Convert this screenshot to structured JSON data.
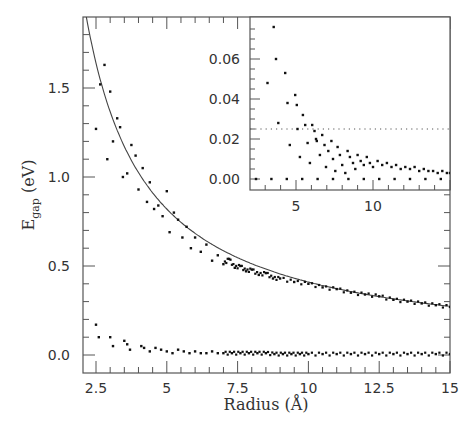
{
  "chart_data": {
    "type": "scatter",
    "title": "",
    "xlabel": "Radius (Å)",
    "ylabel": "E_gap (eV)",
    "ylabel_main": "E",
    "ylabel_sub": "gap",
    "ylabel_unit": "(eV)",
    "xlim": [
      2.04,
      15.0
    ],
    "ylim": [
      -0.1,
      1.9
    ],
    "grid": false,
    "legend": null,
    "x_ticks": [
      2.5,
      5,
      7.5,
      10,
      12.5,
      15
    ],
    "x_tick_labels": [
      "2.5",
      "5",
      "7.5",
      "10",
      "12.5",
      "15"
    ],
    "y_ticks": [
      0.0,
      0.5,
      1.0,
      1.5
    ],
    "y_tick_labels": [
      "0.0",
      "0.5",
      "1.0",
      "1.5"
    ],
    "series": [
      {
        "name": "fit curve",
        "kind": "line",
        "formula": "E = 4.1 / R",
        "x": [
          2.16,
          2.5,
          3,
          3.5,
          4,
          4.5,
          5,
          6,
          7,
          8,
          9,
          10,
          11,
          12,
          13,
          14,
          15
        ],
        "values": [
          1.9,
          1.64,
          1.37,
          1.17,
          1.03,
          0.91,
          0.82,
          0.68,
          0.59,
          0.51,
          0.46,
          0.41,
          0.37,
          0.34,
          0.32,
          0.29,
          0.27
        ]
      },
      {
        "name": "HOMO-LUMO gap (upper branch)",
        "kind": "points",
        "x": [
          2.5,
          2.65,
          2.8,
          2.9,
          3.0,
          3.1,
          3.25,
          3.35,
          3.45,
          3.6,
          3.75,
          3.9,
          4.0,
          4.15,
          4.3,
          4.4,
          4.55,
          4.7,
          4.85,
          5.0,
          5.1,
          5.25,
          5.4,
          5.55,
          5.7,
          5.85,
          6.0,
          6.2,
          6.4,
          6.6,
          6.8,
          7.0,
          7.2,
          7.4,
          7.6,
          7.8,
          8.0,
          8.25,
          8.5,
          8.75,
          9.0,
          9.5,
          10.0,
          10.5,
          11.0,
          11.5,
          12.0,
          12.5,
          13.0,
          13.5,
          14.0,
          14.5,
          15.0
        ],
        "values": [
          1.27,
          1.52,
          1.63,
          1.1,
          1.48,
          1.2,
          1.33,
          1.28,
          1.0,
          1.02,
          1.18,
          1.12,
          0.93,
          1.05,
          0.86,
          0.97,
          0.82,
          0.84,
          0.78,
          0.92,
          0.69,
          0.8,
          0.76,
          0.66,
          0.72,
          0.6,
          0.66,
          0.58,
          0.62,
          0.53,
          0.56,
          0.51,
          0.54,
          0.49,
          0.5,
          0.47,
          0.48,
          0.45,
          0.46,
          0.43,
          0.43,
          0.41,
          0.4,
          0.38,
          0.37,
          0.35,
          0.34,
          0.33,
          0.31,
          0.3,
          0.29,
          0.28,
          0.27
        ]
      },
      {
        "name": "HOMO-LUMO gap (lower branch)",
        "kind": "points",
        "x": [
          2.5,
          2.6,
          3.0,
          3.1,
          3.5,
          3.6,
          3.7,
          4.1,
          4.2,
          4.4,
          4.6,
          4.8,
          5.0,
          5.2,
          5.4,
          5.6,
          5.8,
          6.0,
          6.2,
          6.4,
          6.6,
          6.8,
          7.0,
          7.3,
          7.6,
          7.9,
          8.2,
          8.5,
          8.8,
          9.1,
          9.4,
          9.7,
          10.0,
          10.5,
          11.0,
          11.5,
          12.0,
          12.5,
          13.0,
          13.5,
          14.0,
          14.5,
          15.0
        ],
        "values": [
          0.17,
          0.1,
          0.1,
          0.05,
          0.08,
          0.06,
          0.03,
          0.05,
          0.04,
          0.02,
          0.04,
          0.03,
          0.02,
          0.01,
          0.03,
          0.02,
          0.01,
          0.02,
          0.01,
          0.01,
          0.02,
          0.01,
          0.01,
          0.01,
          0.01,
          0.01,
          0.01,
          0.01,
          0.005,
          0.005,
          0.005,
          0.005,
          0.005,
          0.005,
          0.005,
          0.005,
          0.005,
          0.005,
          0.005,
          0.005,
          0.005,
          0.005,
          0.005
        ]
      }
    ],
    "inset": {
      "type": "scatter",
      "xlim": [
        2.0,
        15.0
      ],
      "ylim": [
        -0.002,
        0.078
      ],
      "x_ticks": [
        5,
        10
      ],
      "x_tick_labels": [
        "5",
        "10"
      ],
      "y_ticks": [
        0.0,
        0.02,
        0.04,
        0.06
      ],
      "y_tick_labels": [
        "0.00",
        "0.02",
        "0.04",
        "0.06"
      ],
      "reference_line": {
        "y": 0.025,
        "style": "dotted"
      },
      "zero_line": {
        "y": 0.0,
        "style": "dotted"
      },
      "series": [
        {
          "name": "small gaps",
          "kind": "points",
          "x": [
            3.15,
            3.55,
            3.7,
            3.85,
            4.3,
            4.45,
            4.6,
            4.95,
            5.05,
            5.1,
            5.25,
            5.45,
            5.6,
            5.75,
            5.9,
            6.05,
            6.2,
            6.3,
            6.35,
            6.55,
            6.7,
            6.85,
            6.95,
            7.1,
            7.3,
            7.4,
            7.55,
            7.7,
            7.85,
            8.0,
            8.2,
            8.35,
            8.5,
            8.7,
            8.85,
            9.0,
            9.2,
            9.4,
            9.6,
            9.8,
            10.0,
            10.3,
            10.6,
            10.9,
            11.2,
            11.5,
            11.8,
            12.1,
            12.4,
            12.7,
            13.0,
            13.3,
            13.6,
            13.9,
            14.2,
            14.5,
            14.8,
            15.0
          ],
          "values": [
            0.048,
            0.076,
            0.06,
            0.028,
            0.053,
            0.038,
            0.017,
            0.042,
            0.037,
            0.025,
            0.011,
            0.032,
            0.027,
            0.018,
            0.008,
            0.027,
            0.024,
            0.02,
            0.019,
            0.012,
            0.022,
            0.017,
            0.006,
            0.014,
            0.019,
            0.01,
            0.004,
            0.016,
            0.012,
            0.007,
            0.003,
            0.014,
            0.011,
            0.008,
            0.005,
            0.012,
            0.009,
            0.007,
            0.011,
            0.008,
            0.006,
            0.009,
            0.007,
            0.008,
            0.006,
            0.007,
            0.005,
            0.006,
            0.005,
            0.006,
            0.004,
            0.005,
            0.004,
            0.004,
            0.003,
            0.004,
            0.003,
            0.003
          ]
        },
        {
          "name": "zero gaps",
          "kind": "points",
          "x": [
            2.4,
            3.4,
            4.4,
            5.4,
            6.4,
            7.4,
            8.4,
            9.4,
            10.4,
            11.4,
            12.4,
            13.4,
            14.4
          ],
          "values": [
            0,
            0,
            0,
            0,
            0,
            0,
            0,
            0,
            0,
            0,
            0,
            0,
            0
          ]
        }
      ]
    }
  },
  "colors": {
    "frame": "#555555",
    "points": "#111111",
    "curve": "#444444",
    "text": "#333333",
    "background": "#ffffff"
  }
}
